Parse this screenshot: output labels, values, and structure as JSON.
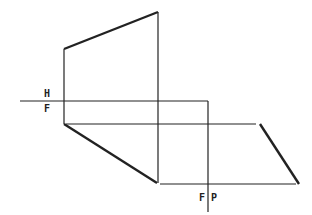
{
  "diagram": {
    "title": "",
    "labels": {
      "upper_plane": "H",
      "lower_plane": "F",
      "fold_left": "F",
      "fold_right": "P"
    },
    "colors": {
      "line": "#222222",
      "background": "#ffffff"
    }
  }
}
